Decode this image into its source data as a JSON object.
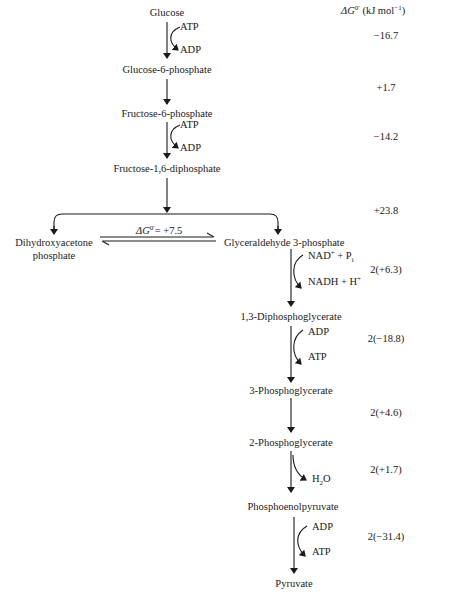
{
  "header": {
    "delta_g_label_sym": "ΔG",
    "delta_g_label_sup": "0′",
    "delta_g_label_unit_pre": " (kJ mol",
    "delta_g_label_unit_sup": "−1",
    "delta_g_label_unit_post": ")"
  },
  "metabolites": [
    {
      "id": "glucose",
      "label": "Glucose"
    },
    {
      "id": "g6p",
      "label": "Glucose-6-phosphate"
    },
    {
      "id": "f6p",
      "label": "Fructose-6-phosphate"
    },
    {
      "id": "f16bp",
      "label": "Fructose-1,6-diphosphate"
    },
    {
      "id": "dhap1",
      "label": "Dihydroxyacetone"
    },
    {
      "id": "dhap2",
      "label": "phosphate"
    },
    {
      "id": "gap",
      "label": "Glyceraldehyde 3-phosphate"
    },
    {
      "id": "bpg13",
      "label": "1,3-Diphosphoglycerate"
    },
    {
      "id": "pg3",
      "label": "3-Phosphoglycerate"
    },
    {
      "id": "pg2",
      "label": "2-Phosphoglycerate"
    },
    {
      "id": "pep",
      "label": "Phosphoenolpyruvate"
    },
    {
      "id": "pyruvate",
      "label": "Pyruvate"
    }
  ],
  "cofactors": {
    "s1_in": "ATP",
    "s1_out": "ADP",
    "s3_in": "ATP",
    "s3_out": "ADP",
    "s6_in_a": "NAD",
    "s6_in_sup": "+",
    "s6_in_b": " + P",
    "s6_in_sub": "i",
    "s6_out_a": "NADH + H",
    "s6_out_sup": "+",
    "s7_in": "ADP",
    "s7_out": "ATP",
    "s9_out_a": "H",
    "s9_out_sub": "2",
    "s9_out_b": "O",
    "s10_in": "ADP",
    "s10_out": "ATP"
  },
  "isomerase": {
    "sym": "ΔG",
    "sup": "0′",
    "value": "= +7.5"
  },
  "delta_g_values": [
    {
      "step": "hexokinase",
      "value": "−16.7"
    },
    {
      "step": "phosphoglucose-isomerase",
      "value": "+1.7"
    },
    {
      "step": "phosphofructokinase",
      "value": "−14.2"
    },
    {
      "step": "aldolase",
      "value": "+23.8"
    },
    {
      "step": "gap-dehydrogenase",
      "value": "2(+6.3)"
    },
    {
      "step": "phosphoglycerate-kinase",
      "value": "2(−18.8)"
    },
    {
      "step": "phosphoglycerate-mutase",
      "value": "2(+4.6)"
    },
    {
      "step": "enolase",
      "value": "2(+1.7)"
    },
    {
      "step": "pyruvate-kinase",
      "value": "2(−31.4)"
    }
  ]
}
